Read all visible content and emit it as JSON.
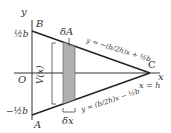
{
  "diagram": {
    "axis_labels": {
      "y": "y",
      "x": "x",
      "origin": "O"
    },
    "points": {
      "B": "B",
      "A": "A",
      "C": "C"
    },
    "y_ticks": {
      "top": "½b",
      "bottom": "−½b"
    },
    "strip_label": "δA",
    "width_label": "δx",
    "height_label": "V(x)",
    "upper_line_eq": "y = −(b/2h)x + ½b",
    "lower_line_eq": "y = (b/2h)x − ½b",
    "vertical_line_eq": "x = h",
    "colors": {
      "line": "#222222",
      "strip_fill": "#b0b0b0",
      "axis": "#333333"
    }
  }
}
